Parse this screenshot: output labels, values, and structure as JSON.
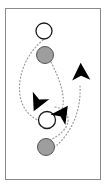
{
  "figure": {
    "title": "",
    "width": 110,
    "height": 187,
    "background_color": "#ffffff",
    "frame": {
      "name": "panel-border",
      "x": 5.5,
      "y": 8.5,
      "width": 95,
      "height": 171,
      "stroke_color": "#8a8a8a",
      "stroke_width": 1,
      "fill": "#ffffff"
    },
    "colors": {
      "outline": "#1a1a1a",
      "marker_open_fill": "#ffffff",
      "marker_filled_fill": "#9e9e9e",
      "arrowhead_fill": "#000000",
      "path_stroke": "#9a9a9a"
    },
    "markers": [
      {
        "name": "open-circle-top",
        "type": "circle-open",
        "cx": 44,
        "cy": 31,
        "r": 8,
        "fill": "#ffffff",
        "stroke": "#1a1a1a",
        "stroke_width": 1.3
      },
      {
        "name": "filled-circle-upper",
        "type": "circle-filled",
        "cx": 45,
        "cy": 55,
        "r": 8.5,
        "fill": "#9e9e9e",
        "stroke": "#555555",
        "stroke_width": 1.0
      },
      {
        "name": "open-circle-lower",
        "type": "circle-open",
        "cx": 47,
        "cy": 120,
        "r": 8.5,
        "fill": "#ffffff",
        "stroke": "#1a1a1a",
        "stroke_width": 1.3
      },
      {
        "name": "filled-circle-bottom",
        "type": "circle-filled",
        "cx": 46,
        "cy": 147,
        "r": 8.5,
        "fill": "#9e9e9e",
        "stroke": "#555555",
        "stroke_width": 1.0
      }
    ],
    "arrowheads": [
      {
        "name": "arrowhead-up-right",
        "direction": "up",
        "cx": 81,
        "cy": 73,
        "size": 13,
        "rotation": -2,
        "fill": "#000000"
      },
      {
        "name": "arrowhead-left-middle",
        "direction": "left",
        "cx": 38,
        "cy": 102,
        "size": 13,
        "rotation": 205,
        "fill": "#000000"
      },
      {
        "name": "arrowhead-right-lower",
        "direction": "right",
        "cx": 62,
        "cy": 114,
        "size": 13,
        "rotation": 35,
        "fill": "#000000"
      }
    ],
    "paths": [
      {
        "name": "trajectory-left",
        "style": "dotted",
        "d": "M 43 40 C 28 52, 17 74, 20 95 C 22 110, 32 118, 40 121",
        "stroke": "#9a9a9a",
        "stroke_width": 1.2,
        "dash": "1,2.4"
      },
      {
        "name": "trajectory-center",
        "style": "dotted",
        "d": "M 51 62 C 60 80, 66 96, 62 110",
        "stroke": "#9a9a9a",
        "stroke_width": 1.2,
        "dash": "1,2.4"
      },
      {
        "name": "trajectory-right",
        "style": "dotted",
        "d": "M 80 86 C 81 104, 76 124, 62 140 C 58 145, 53 148, 50 150",
        "stroke": "#9a9a9a",
        "stroke_width": 1.2,
        "dash": "1,2.4"
      },
      {
        "name": "trajectory-inner-loop",
        "style": "dotted",
        "d": "M 55 107 C 68 109, 72 120, 64 130 C 58 137, 50 140, 47 141",
        "stroke": "#9a9a9a",
        "stroke_width": 1.2,
        "dash": "1,2.4"
      }
    ]
  }
}
